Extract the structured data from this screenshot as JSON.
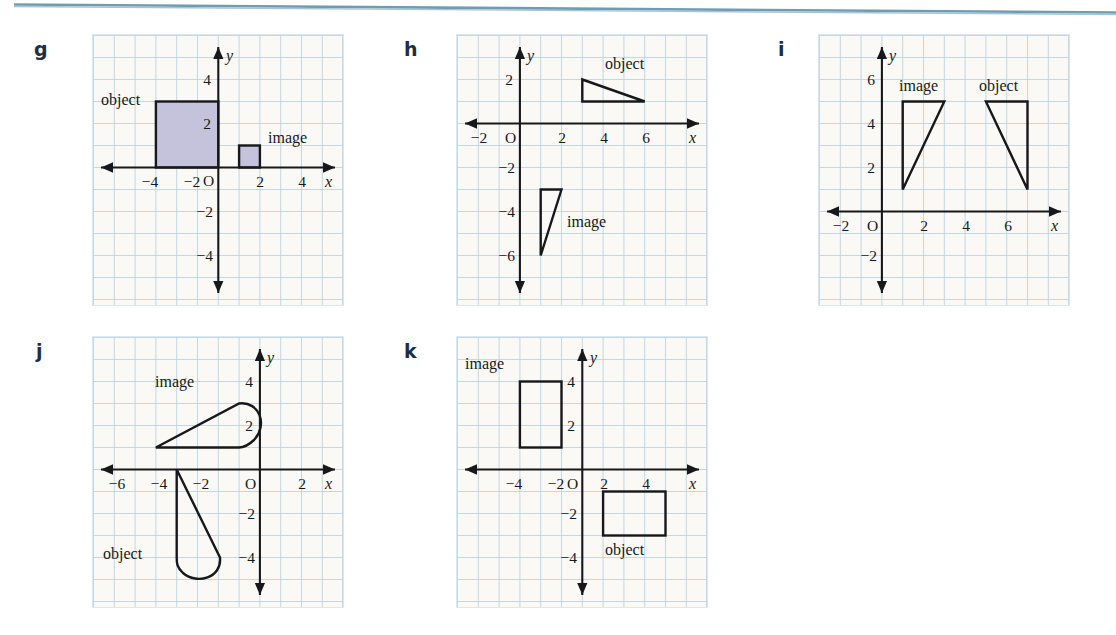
{
  "page": {
    "background_color": "#ffffff",
    "grid_background_color": "#fbf9f5",
    "grid_line_color": "#bcd2e2",
    "axis_color": "#16181b",
    "letter_color": "#1d2d44",
    "shape_fill_color": "#c5c3dc",
    "scan_rule_color": "#6f9cb3"
  },
  "labels": {
    "object": "object",
    "image": "image",
    "origin": "O",
    "x_axis": "x",
    "y_axis": "y"
  },
  "panels": [
    {
      "letter": "g",
      "x_ticks": [
        "−4",
        "−2",
        "2",
        "4"
      ],
      "x_tick_values": [
        -4,
        -2,
        2,
        4
      ],
      "y_ticks": [
        "4",
        "2",
        "−2",
        "−4"
      ],
      "y_tick_values": [
        4,
        2,
        -2,
        -4
      ],
      "x_range": [
        -6,
        6
      ],
      "y_range": [
        -6,
        6
      ],
      "shapes": [
        {
          "role": "object",
          "kind": "square",
          "filled": true,
          "vertices": [
            [
              -3,
              0
            ],
            [
              -3,
              3
            ],
            [
              0,
              3
            ],
            [
              0,
              0
            ]
          ],
          "label": "object",
          "label_at": [
            -5.6,
            3.9
          ]
        },
        {
          "role": "image",
          "kind": "square",
          "filled": true,
          "vertices": [
            [
              1,
              0
            ],
            [
              1,
              1
            ],
            [
              2,
              1
            ],
            [
              2,
              0
            ]
          ],
          "label": "image",
          "label_at": [
            2.4,
            1.85
          ]
        }
      ]
    },
    {
      "letter": "h",
      "x_ticks": [
        "−2",
        "2",
        "4",
        "6"
      ],
      "x_tick_values": [
        -2,
        2,
        4,
        6
      ],
      "y_ticks": [
        "2",
        "−2",
        "−4",
        "−6"
      ],
      "y_tick_values": [
        2,
        -2,
        -4,
        -6
      ],
      "x_range": [
        -4,
        8
      ],
      "y_range": [
        -8,
        4
      ],
      "shapes": [
        {
          "role": "object",
          "kind": "triangle",
          "filled": false,
          "vertices": [
            [
              3,
              2
            ],
            [
              6,
              1
            ],
            [
              3,
              1
            ]
          ],
          "label": "object",
          "label_at": [
            4.1,
            3.3
          ]
        },
        {
          "role": "image",
          "kind": "triangle",
          "filled": false,
          "vertices": [
            [
              1,
              -3
            ],
            [
              2,
              -3
            ],
            [
              1,
              -6
            ]
          ],
          "label": "image",
          "label_at": [
            2.4,
            -4.3
          ]
        }
      ]
    },
    {
      "letter": "i",
      "x_ticks": [
        "−2",
        "2",
        "4",
        "6"
      ],
      "x_tick_values": [
        -2,
        2,
        4,
        6
      ],
      "y_ticks": [
        "6",
        "4",
        "2",
        "−2"
      ],
      "y_tick_values": [
        6,
        4,
        2,
        -2
      ],
      "x_range": [
        -4,
        8
      ],
      "y_range": [
        -4,
        8
      ],
      "shapes": [
        {
          "role": "image",
          "kind": "triangle",
          "filled": false,
          "vertices": [
            [
              1,
              1
            ],
            [
              1,
              5
            ],
            [
              3,
              5
            ]
          ],
          "label": "image",
          "label_at": [
            1.0,
            6.25
          ]
        },
        {
          "role": "object",
          "kind": "triangle",
          "filled": false,
          "vertices": [
            [
              5,
              5
            ],
            [
              7,
              5
            ],
            [
              7,
              1
            ]
          ],
          "label": "object",
          "label_at": [
            4.9,
            6.25
          ]
        }
      ]
    },
    {
      "letter": "j",
      "x_ticks": [
        "−6",
        "−4",
        "−2",
        "2"
      ],
      "x_tick_values": [
        -6,
        -4,
        -2,
        2
      ],
      "y_ticks": [
        "4",
        "2",
        "−2",
        "−4"
      ],
      "y_tick_values": [
        4,
        2,
        -2,
        -4
      ],
      "x_range": [
        -8,
        4
      ],
      "y_range": [
        -6,
        6
      ],
      "shapes": [
        {
          "role": "image",
          "kind": "rounded-wedge",
          "filled": false,
          "vertices": [
            [
              -5,
              1
            ],
            [
              -1,
              3
            ],
            [
              0,
              2
            ],
            [
              -1,
              1
            ]
          ],
          "label": "image",
          "label_at": [
            -4.3,
            4.05
          ]
        },
        {
          "role": "object",
          "kind": "rounded-wedge",
          "filled": false,
          "vertices": [
            [
              -4,
              0
            ],
            [
              -2,
              -4
            ],
            [
              -3,
              -5
            ],
            [
              -4,
              -4
            ]
          ],
          "label": "object",
          "label_at": [
            -6.9,
            -3.5
          ]
        }
      ]
    },
    {
      "letter": "k",
      "x_ticks": [
        "−4",
        "−2",
        "2",
        "4"
      ],
      "x_tick_values": [
        -4,
        -2,
        2,
        4
      ],
      "y_ticks": [
        "4",
        "2",
        "−2",
        "−4"
      ],
      "y_tick_values": [
        4,
        2,
        -2,
        -4
      ],
      "x_range": [
        -6,
        6
      ],
      "y_range": [
        -6,
        6
      ],
      "shapes": [
        {
          "role": "image",
          "kind": "rectangle",
          "filled": false,
          "vertices": [
            [
              -3,
              1
            ],
            [
              -3,
              4
            ],
            [
              -1,
              4
            ],
            [
              -1,
              1
            ]
          ],
          "label": "image",
          "label_at": [
            -5.5,
            5.1
          ]
        },
        {
          "role": "object",
          "kind": "rectangle",
          "filled": false,
          "vertices": [
            [
              1,
              -3
            ],
            [
              1,
              -1
            ],
            [
              4,
              -1
            ],
            [
              4,
              -3
            ]
          ],
          "label": "object",
          "label_at": [
            1.3,
            -4.2
          ]
        }
      ]
    }
  ]
}
